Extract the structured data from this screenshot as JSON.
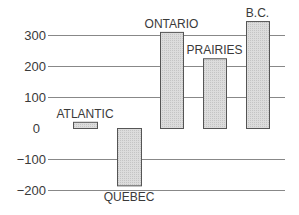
{
  "chart_data": {
    "type": "bar",
    "title": "",
    "xlabel": "",
    "ylabel": "",
    "categories": [
      "ATLANTIC",
      "QUEBEC",
      "ONTARIO",
      "PRAIRIES",
      "B.C."
    ],
    "values": [
      20,
      -185,
      310,
      225,
      345
    ],
    "yticks": [
      300,
      200,
      100,
      0,
      -100,
      -200
    ],
    "ytick_labels": [
      "300",
      "200",
      "100",
      "0",
      "-100",
      "-200"
    ],
    "ylim": [
      -200,
      350
    ],
    "grid": true,
    "gridlines_drawn_at": [
      300,
      200,
      100,
      -100,
      -200
    ],
    "legend": null,
    "bar_color": "#d9d9d9",
    "bar_edge_color": "#555555",
    "grid_color": "#888888"
  }
}
